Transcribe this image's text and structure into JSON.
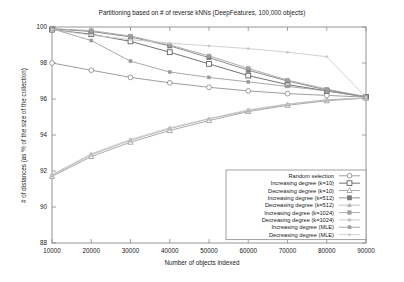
{
  "chart_data": {
    "type": "line",
    "title": "Partitioning based on # of reverse kNNs (DeepFeatures, 100,000 objects)",
    "xlabel": "Number of objects indexed",
    "ylabel": "# of distances (as % of the size of the collection)",
    "x": [
      10000,
      20000,
      30000,
      40000,
      50000,
      60000,
      70000,
      80000,
      90000
    ],
    "xticklabels": [
      "10000",
      "20000",
      "30000",
      "40000",
      "50000",
      "60000",
      "70000",
      "80000",
      "90000"
    ],
    "yticklabels": [
      "88",
      "90",
      "92",
      "94",
      "96",
      "98",
      "100"
    ],
    "yticks": [
      88,
      90,
      92,
      94,
      96,
      98,
      100
    ],
    "xlim": [
      10000,
      90000
    ],
    "ylim": [
      88,
      100
    ],
    "grid": false,
    "legend_position": "bottom-right",
    "series": [
      {
        "name": "Random selection",
        "marker": "open-circle",
        "color": "#8d8d8d",
        "values": [
          98.0,
          97.6,
          97.2,
          96.9,
          96.65,
          96.45,
          96.3,
          96.2,
          96.1
        ]
      },
      {
        "name": "Increasing degree (k=10)",
        "marker": "open-square",
        "color": "#5a5a5a",
        "values": [
          99.85,
          99.6,
          99.2,
          98.6,
          97.95,
          97.3,
          96.8,
          96.45,
          96.12
        ]
      },
      {
        "name": "Decreasing degree (k=10)",
        "marker": "open-triangle",
        "color": "#9c9c9c",
        "values": [
          91.7,
          92.8,
          93.6,
          94.25,
          94.8,
          95.3,
          95.65,
          95.9,
          96.05
        ]
      },
      {
        "name": "Increasing degree (k=512)",
        "marker": "filled-square",
        "color": "#7a7a7a",
        "values": [
          99.9,
          99.75,
          99.45,
          98.95,
          98.3,
          97.6,
          97.0,
          96.5,
          96.12
        ]
      },
      {
        "name": "Decreasing degree (k=512)",
        "marker": "small-triangle",
        "color": "#b4b4b4",
        "values": [
          91.75,
          92.9,
          93.7,
          94.35,
          94.9,
          95.35,
          95.7,
          95.95,
          96.05
        ]
      },
      {
        "name": "Increasing degree (k=1024)",
        "marker": "filled-square-sm",
        "color": "#a0a0a0",
        "values": [
          99.9,
          99.8,
          99.5,
          99.0,
          98.4,
          97.7,
          97.05,
          96.55,
          96.12
        ]
      },
      {
        "name": "Decreasing degree (k=1024)",
        "marker": "small-dot",
        "color": "#c0c0c0",
        "values": [
          91.8,
          92.95,
          93.75,
          94.4,
          94.9,
          95.4,
          95.72,
          95.97,
          96.05
        ]
      },
      {
        "name": "Increasing degree (MLE)",
        "marker": "filled-sq-tiny",
        "color": "#9a9a9a",
        "values": [
          99.9,
          99.25,
          98.1,
          97.5,
          97.2,
          96.95,
          96.7,
          96.45,
          96.1
        ]
      },
      {
        "name": "Decreasing degree (MLE)",
        "marker": "tiny-dot",
        "color": "#c8c8c8",
        "values": [
          99.85,
          99.55,
          99.3,
          99.1,
          98.95,
          98.8,
          98.6,
          98.35,
          96.1
        ]
      }
    ]
  }
}
